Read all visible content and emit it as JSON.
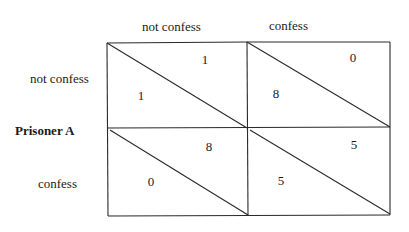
{
  "matrix": {
    "column_headers": [
      "not confess",
      "confess"
    ],
    "row_player": "Prisoner A",
    "row_headers": [
      "not confess",
      "confess"
    ],
    "cells": [
      [
        {
          "upper_right": "1",
          "lower_left": "1"
        },
        {
          "upper_right": "0",
          "lower_left": "8"
        }
      ],
      [
        {
          "upper_right": "8",
          "lower_left": "0"
        },
        {
          "upper_right": "5",
          "lower_left": "5"
        }
      ]
    ]
  }
}
